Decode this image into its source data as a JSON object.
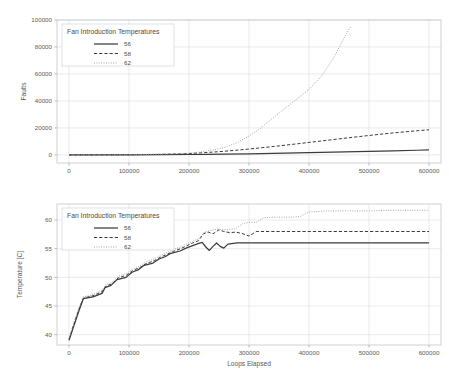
{
  "figure": {
    "background_color": "#ffffff",
    "grid_color": "#d8dce3",
    "text_color": "#5a5a5a"
  },
  "legend": {
    "title": "Fan Introduction Temperatures",
    "entries": [
      {
        "label": "56",
        "style": "solid",
        "color": "#3c3c3c"
      },
      {
        "label": "58",
        "style": "dashed",
        "color": "#3c3c3c"
      },
      {
        "label": "62",
        "style": "dotted",
        "color": "#9a9a9a"
      }
    ]
  },
  "chart_data": [
    {
      "type": "line",
      "title": "",
      "xlabel": "",
      "ylabel": "Faults",
      "xlim": [
        -20000,
        620000
      ],
      "ylim": [
        -6000,
        100000
      ],
      "xticks": [
        0,
        100000,
        200000,
        300000,
        400000,
        500000,
        600000
      ],
      "xticklabels": [
        "0",
        "100000",
        "200000",
        "300000",
        "400000",
        "500000",
        "600000"
      ],
      "yticks": [
        0,
        20000,
        40000,
        60000,
        80000,
        100000
      ],
      "yticklabels": [
        "0",
        "20000",
        "40000",
        "60000",
        "80000",
        "100000"
      ],
      "grid": true,
      "legend_position": "upper left",
      "series": [
        {
          "name": "56",
          "style": "solid",
          "color": "#3c3c3c",
          "x": [
            0,
            50000,
            100000,
            150000,
            200000,
            230000,
            260000,
            300000,
            340000,
            380000,
            420000,
            460000,
            500000,
            540000,
            580000,
            600000
          ],
          "y": [
            0,
            20,
            60,
            140,
            300,
            420,
            560,
            800,
            1100,
            1450,
            1850,
            2250,
            2650,
            3050,
            3450,
            3650
          ]
        },
        {
          "name": "58",
          "style": "dashed",
          "color": "#3c3c3c",
          "x": [
            0,
            50000,
            100000,
            150000,
            180000,
            200000,
            220000,
            250000,
            280000,
            310000,
            340000,
            380000,
            420000,
            460000,
            500000,
            540000,
            580000,
            600000
          ],
          "y": [
            0,
            40,
            130,
            400,
            700,
            1000,
            1500,
            2400,
            3500,
            4800,
            6200,
            8200,
            10300,
            12400,
            14400,
            16300,
            17900,
            18600
          ]
        },
        {
          "name": "62",
          "style": "dotted",
          "color": "#9a9a9a",
          "x": [
            0,
            50000,
            100000,
            150000,
            180000,
            200000,
            220000,
            240000,
            260000,
            280000,
            300000,
            320000,
            340000,
            360000,
            380000,
            400000,
            420000,
            440000,
            460000,
            470000
          ],
          "y": [
            0,
            50,
            160,
            500,
            900,
            1300,
            2200,
            3600,
            5600,
            9000,
            14000,
            20000,
            27500,
            34500,
            41500,
            48500,
            58000,
            71000,
            88000,
            95500
          ]
        }
      ]
    },
    {
      "type": "line",
      "title": "",
      "xlabel": "Loops Elapsed",
      "ylabel": "Temperature [C]",
      "xlim": [
        -20000,
        620000
      ],
      "ylim": [
        38.2,
        62.8
      ],
      "xticks": [
        0,
        100000,
        200000,
        300000,
        400000,
        500000,
        600000
      ],
      "xticklabels": [
        "0",
        "100000",
        "200000",
        "300000",
        "400000",
        "500000",
        "600000"
      ],
      "yticks": [
        40,
        45,
        50,
        55,
        60
      ],
      "yticklabels": [
        "40",
        "45",
        "50",
        "55",
        "60"
      ],
      "grid": true,
      "legend_position": "upper left",
      "series": [
        {
          "name": "56",
          "style": "solid",
          "color": "#3c3c3c",
          "x": [
            0,
            8000,
            16000,
            24000,
            40000,
            55000,
            60000,
            70000,
            80000,
            95000,
            105000,
            115000,
            125000,
            140000,
            150000,
            160000,
            170000,
            185000,
            195000,
            205000,
            215000,
            222000,
            228000,
            234000,
            240000,
            246000,
            252000,
            258000,
            265000,
            280000,
            300000,
            360000,
            450000,
            540000,
            600000
          ],
          "y": [
            39.0,
            41.5,
            44.0,
            46.3,
            46.6,
            47.2,
            48.2,
            48.6,
            49.6,
            50.0,
            50.9,
            51.3,
            52.1,
            52.5,
            53.2,
            53.6,
            54.2,
            54.6,
            55.1,
            55.5,
            55.9,
            56.1,
            55.3,
            54.7,
            55.4,
            56.0,
            55.4,
            55.1,
            55.8,
            56.0,
            56.0,
            56.0,
            56.0,
            56.0,
            56.0
          ]
        },
        {
          "name": "58",
          "style": "dashed",
          "color": "#3c3c3c",
          "x": [
            0,
            8000,
            16000,
            24000,
            40000,
            55000,
            62000,
            72000,
            82000,
            96000,
            106000,
            118000,
            128000,
            142000,
            152000,
            163000,
            173000,
            186000,
            196000,
            206000,
            216000,
            224000,
            232000,
            240000,
            250000,
            258000,
            268000,
            278000,
            290000,
            300000,
            312000,
            320000,
            340000,
            400000,
            470000,
            540000,
            600000
          ],
          "y": [
            39.2,
            41.8,
            44.3,
            46.4,
            46.8,
            47.5,
            48.5,
            48.9,
            49.9,
            50.4,
            51.2,
            51.7,
            52.4,
            52.9,
            53.5,
            54.0,
            54.5,
            55.0,
            55.5,
            56.0,
            56.4,
            57.6,
            57.9,
            57.6,
            58.3,
            58.0,
            57.8,
            57.9,
            57.6,
            57.2,
            58.0,
            58.0,
            58.0,
            58.0,
            58.0,
            58.0,
            58.0
          ]
        },
        {
          "name": "62",
          "style": "dotted",
          "color": "#9a9a9a",
          "x": [
            0,
            8000,
            16000,
            24000,
            40000,
            55000,
            62000,
            72000,
            82000,
            96000,
            106000,
            118000,
            128000,
            142000,
            152000,
            163000,
            173000,
            186000,
            196000,
            206000,
            216000,
            226000,
            236000,
            248000,
            258000,
            268000,
            278000,
            288000,
            300000,
            312000,
            325000,
            340000,
            355000,
            370000,
            385000,
            400000,
            415000,
            430000,
            450000,
            470000,
            500000,
            540000,
            580000,
            600000
          ],
          "y": [
            39.4,
            42.1,
            44.6,
            46.6,
            47.0,
            47.8,
            48.8,
            49.2,
            50.2,
            50.7,
            51.5,
            52.0,
            52.7,
            53.2,
            53.8,
            54.3,
            54.8,
            55.3,
            55.8,
            56.3,
            56.7,
            57.9,
            58.2,
            58.4,
            58.3,
            58.4,
            58.5,
            59.3,
            59.6,
            59.6,
            60.4,
            60.5,
            60.5,
            60.5,
            60.6,
            61.4,
            61.5,
            61.6,
            61.6,
            61.6,
            61.6,
            61.7,
            61.7,
            61.7
          ]
        }
      ]
    }
  ]
}
